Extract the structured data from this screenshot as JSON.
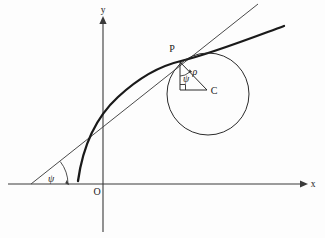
{
  "figure": {
    "type": "geometry-diagram",
    "background_color": "#fdfdfd",
    "ink_color": "#1a1a1a"
  },
  "axes": {
    "x_label": "x",
    "y_label": "y",
    "origin_label": "O",
    "x_axis": {
      "start_x": 8,
      "end_x": 305,
      "y": 184
    },
    "y_axis": {
      "x": 103,
      "start_y": 20,
      "end_y": 232
    }
  },
  "points": [
    {
      "name": "P",
      "label": "P",
      "x": 180,
      "y": 62,
      "role": "point-of-tangency"
    },
    {
      "name": "C",
      "label": "C",
      "x": 207,
      "y": 90,
      "role": "center-of-curvature"
    },
    {
      "name": "O",
      "label": "O",
      "x": 103,
      "y": 184,
      "role": "origin"
    }
  ],
  "labels": {
    "rho": "ρ",
    "psi_at_point": "ψ",
    "psi_at_axis": "ψ",
    "point_p": "P",
    "point_c": "C",
    "origin": "O",
    "x_axis": "x",
    "y_axis": "y"
  },
  "circle": {
    "center_x": 208,
    "center_y": 94,
    "radius": 41,
    "stroke_color": "#2b2b2b",
    "name": "osculating-circle"
  },
  "curve": {
    "name": "plane-curve",
    "stroke_color": "#1a1a1a",
    "stroke_width": 2.3,
    "path": "M 78,181 C 84,150 95,118 120,96 C 148,71 180,62 180,62 C 208,53 245,40 283,26"
  },
  "tangent": {
    "name": "tangent-line",
    "stroke_color": "#4a4a4a",
    "start_x": 31,
    "start_y": 184,
    "end_x": 258,
    "end_y": 4
  },
  "triangle": {
    "name": "radius-right-triangle",
    "vertex_p": {
      "x": 180,
      "y": 62
    },
    "vertex_c": {
      "x": 207,
      "y": 90
    },
    "vertex_corner": {
      "x": 180,
      "y": 90
    },
    "right_angle_at": "corner"
  },
  "angles": [
    {
      "name": "psi-at-point-p",
      "label": "ψ",
      "label_x": 186,
      "label_y": 80
    },
    {
      "name": "psi-at-x-axis",
      "label": "ψ",
      "label_x": 50,
      "label_y": 181
    }
  ],
  "annotations": [
    {
      "name": "rho-radius-label",
      "label": "ρ",
      "x": 194,
      "y": 74
    }
  ]
}
